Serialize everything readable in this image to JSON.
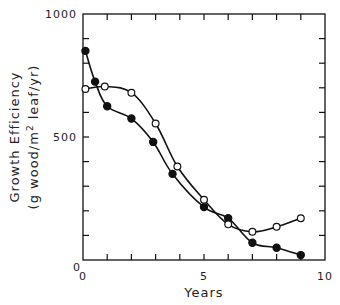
{
  "chart_data": {
    "type": "line",
    "title": "",
    "xlabel": "Years",
    "ylabel_line1": "Growth Efficiency",
    "ylabel_line2_pre": "(g wood/m",
    "ylabel_line2_sup": "2",
    "ylabel_line2_post": " leaf/yr)",
    "xlim": [
      0,
      10
    ],
    "ylim": [
      0,
      1000
    ],
    "x_tick_labels": [
      "0",
      "5",
      "10"
    ],
    "x_tick_label_values": [
      0,
      5,
      10
    ],
    "x_minor_ticks": [
      1,
      2,
      3,
      4,
      5,
      6,
      7,
      8,
      9
    ],
    "y_tick_labels": [
      "1000",
      "500",
      "0"
    ],
    "y_tick_label_values": [
      1000,
      500,
      0
    ],
    "y_minor_ticks": [
      100,
      200,
      300,
      400,
      500,
      600,
      700,
      800,
      900
    ],
    "grid": false,
    "legend": null,
    "series": [
      {
        "name": "filled circles",
        "marker": "filled-circle",
        "x": [
          0.1,
          0.5,
          1.0,
          2.0,
          2.9,
          3.7,
          5.0,
          6.0,
          7.0,
          8.0,
          9.0
        ],
        "y": [
          850,
          725,
          625,
          575,
          480,
          350,
          215,
          170,
          70,
          50,
          20
        ]
      },
      {
        "name": "open circles",
        "marker": "open-circle",
        "x": [
          0.1,
          0.9,
          2.0,
          3.0,
          3.9,
          5.0,
          6.0,
          7.0,
          8.0,
          9.0
        ],
        "y": [
          695,
          705,
          680,
          555,
          380,
          245,
          145,
          115,
          135,
          170
        ]
      }
    ]
  },
  "colors": {
    "ink": "#111111",
    "background": "#ffffff"
  }
}
